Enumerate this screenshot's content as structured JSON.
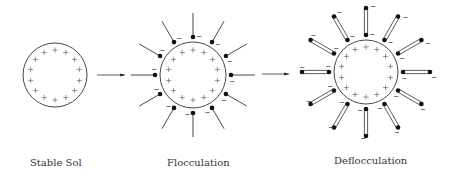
{
  "figure": {
    "background": "#ffffff",
    "stroke_color": "#333333",
    "dot_color": "#111111",
    "panels": [
      {
        "id": "stable-sol",
        "label": "Stable Sol",
        "label_pos": [
          30,
          166
        ],
        "center": [
          55,
          75
        ],
        "radius": 32,
        "plus_count": 14,
        "plus_radius": 25,
        "adsorbed": "none"
      },
      {
        "id": "flocculation",
        "label": "Flocculation",
        "label_pos": [
          167,
          166
        ],
        "center": [
          193,
          75
        ],
        "radius": 33,
        "plus_count": 14,
        "plus_radius": 25,
        "adsorbed": "single",
        "chain_count": 12,
        "dot_radius_from_center": 38,
        "chain_end_radius": 62,
        "charge_sign": "−"
      },
      {
        "id": "deflocculation",
        "label": "Deflocculation",
        "label_pos": [
          334,
          164
        ],
        "center": [
          366,
          72
        ],
        "radius": 32,
        "plus_count": 14,
        "plus_radius": 25,
        "adsorbed": "double",
        "chain_count": 12,
        "dot_radius_from_center": 37,
        "chain_end_radius": 64,
        "charge_sign": "−"
      }
    ],
    "arrows": [
      {
        "id": "arrow-to-flocculation",
        "from": [
          97,
          75
        ],
        "to": [
          125,
          75
        ]
      },
      {
        "id": "arrow-to-deflocculation",
        "from": [
          262,
          74
        ],
        "to": [
          289,
          74
        ]
      }
    ]
  }
}
